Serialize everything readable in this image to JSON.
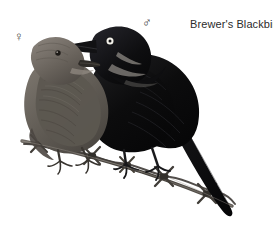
{
  "plate": {
    "title": "Brewer's Blackbird",
    "background_color": "#ffffff",
    "width": 273,
    "height": 246,
    "medium": "field-guide illustration",
    "subject_count": 2
  },
  "labels": {
    "species_name": "Brewer's Blackbird",
    "species_name_color": "#2b2b2b",
    "female_symbol": "♀",
    "male_symbol": "♂",
    "symbol_color": "#3a3a3a"
  },
  "birds": [
    {
      "sex": "female",
      "symbol": "♀",
      "position": "left",
      "plumage_color": "#6b6660",
      "plumage_description": "uniform gray-brown",
      "eye_color": "#241f1c",
      "eye_description": "dark eye",
      "bill_color": "#2a2724",
      "facing": "right"
    },
    {
      "sex": "male",
      "symbol": "♂",
      "position": "right",
      "plumage_color": "#0d0d0e",
      "plumage_description": "glossy black",
      "eye_color": "#f2f0ea",
      "eye_description": "pale white iris with dark pupil",
      "bill_color": "#111111",
      "facing": "left"
    }
  ],
  "perch": {
    "type": "barbed-wire",
    "color": "#4a4641",
    "barb_count": 5,
    "orientation": "diagonal, upper-left to lower-right"
  },
  "palette": {
    "black": "#0d0d0e",
    "dark_gray": "#2b2b2b",
    "mid_gray": "#6b6660",
    "light_gray": "#9a948c",
    "highlight": "#d8d4cc",
    "white": "#ffffff"
  }
}
